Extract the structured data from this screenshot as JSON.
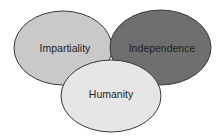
{
  "diagram": {
    "type": "overlapping-ellipses",
    "colors": {
      "background": "#ffffff",
      "outline": "#3a3a3a",
      "text": "#1e1e1e"
    },
    "ellipses": [
      {
        "label": "Impartiality",
        "cx": 63,
        "cy": 48,
        "rx": 49,
        "ry": 37,
        "fill": "#c9c9c9",
        "label_x": 65,
        "label_y": 49
      },
      {
        "label": "Independence",
        "cx": 160.5,
        "cy": 47.5,
        "rx": 50.5,
        "ry": 37.5,
        "fill": "#6f6f6f",
        "label_x": 162,
        "label_y": 49
      },
      {
        "label": "Humanity",
        "cx": 111,
        "cy": 96,
        "rx": 50,
        "ry": 36,
        "fill": "#e6e6e6",
        "label_x": 111,
        "label_y": 95
      }
    ]
  }
}
